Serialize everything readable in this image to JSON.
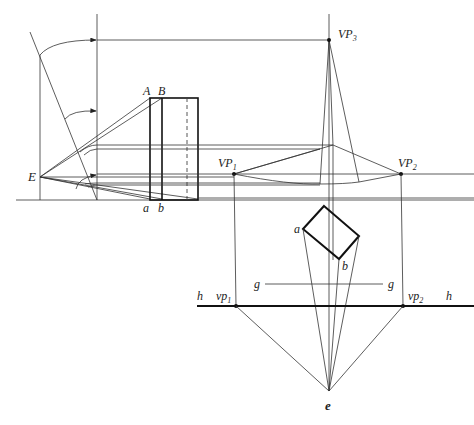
{
  "figure": {
    "colors": {
      "line": "#333333",
      "background": "#ffffff"
    }
  },
  "labels": {
    "E": "E",
    "A": "A",
    "B": "B",
    "a_upper": "a",
    "b_upper": "b",
    "VP1": "VP",
    "VP1_sub": "1",
    "VP2": "VP",
    "VP2_sub": "2",
    "VP3": "VP",
    "VP3_sub": "3",
    "a_plan": "a",
    "b_plan": "b",
    "g_left": "g",
    "g_right": "g",
    "h_left": "h",
    "h_right": "h",
    "vp1": "vp",
    "vp1_sub": "1",
    "vp2": "vp",
    "vp2_sub": "2",
    "e": "e"
  },
  "points": {
    "E": [
      40,
      177
    ],
    "VP1": [
      234,
      174
    ],
    "VP2": [
      401,
      174
    ],
    "VP3": [
      329,
      40
    ],
    "vp1": [
      236,
      306
    ],
    "vp2": [
      403,
      306
    ],
    "e": [
      329,
      391
    ]
  }
}
